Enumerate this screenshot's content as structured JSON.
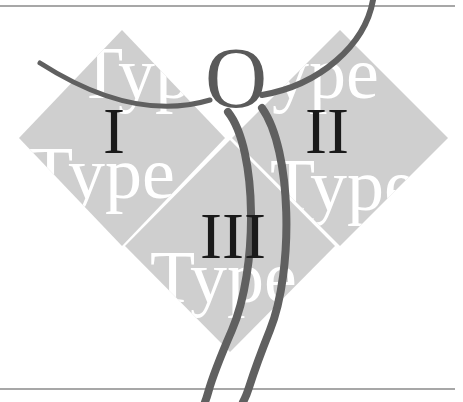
{
  "figure": {
    "colors": {
      "background": "#ffffff",
      "rule": "#8a8a8a",
      "diamond_fill": "#cfcfcf",
      "watermark_text": "#ffffff",
      "numeral_text": "#1a1a1a",
      "figure_stroke": "#606060"
    },
    "diamonds": [
      {
        "id": "type-1",
        "watermark_top": "Type",
        "watermark_bottom": "Type",
        "numeral": "I"
      },
      {
        "id": "type-2",
        "watermark_top": "Type",
        "watermark_bottom": "Type",
        "numeral": "II"
      },
      {
        "id": "type-3",
        "watermark_top": "Type",
        "numeral": "III"
      }
    ],
    "human_figure": {
      "head_glyph": "O"
    }
  }
}
